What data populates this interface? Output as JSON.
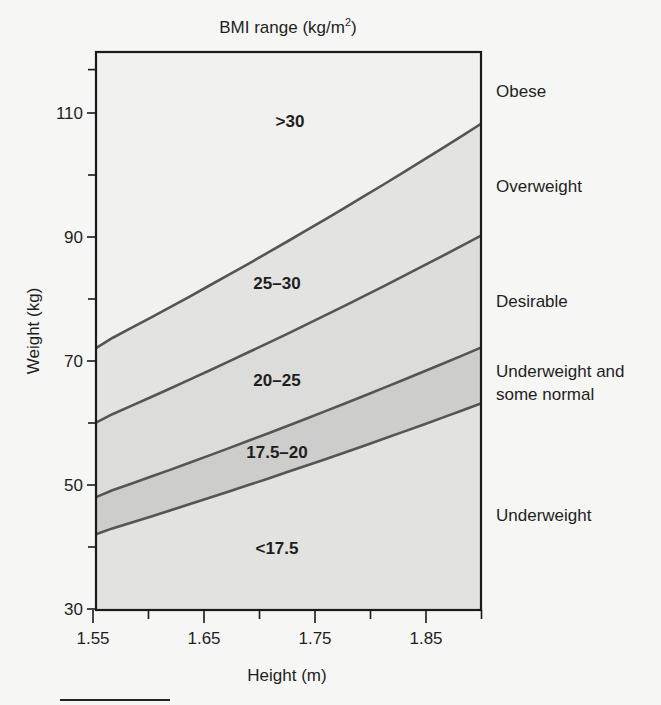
{
  "chart_data": {
    "type": "area",
    "title_main": "BMI range (kg/m",
    "title_sup": "2",
    "title_close": ")",
    "xlabel": "Height (m)",
    "ylabel": "Weight (kg)",
    "xlim": [
      1.55,
      1.9
    ],
    "ylim": [
      30,
      118
    ],
    "x_ticks_major": [
      1.55,
      1.65,
      1.75,
      1.85
    ],
    "x_tick_labels": [
      "1.55",
      "1.65",
      "1.75",
      "1.85"
    ],
    "x_ticks_minor": [
      1.6,
      1.7,
      1.8,
      1.9
    ],
    "y_ticks_major": [
      30,
      50,
      70,
      90,
      110
    ],
    "y_tick_labels": [
      "30",
      "50",
      "70",
      "90",
      "110"
    ],
    "y_ticks_minor": [
      40,
      60,
      80,
      100,
      117
    ],
    "grid": false,
    "boundary_lines": [
      {
        "bmi": 30,
        "x": [
          1.55,
          1.9
        ],
        "y": [
          72.1,
          108.3
        ]
      },
      {
        "bmi": 25,
        "x": [
          1.55,
          1.9
        ],
        "y": [
          60.1,
          90.3
        ]
      },
      {
        "bmi": 20,
        "x": [
          1.55,
          1.9
        ],
        "y": [
          48.1,
          72.2
        ]
      },
      {
        "bmi": 17.5,
        "x": [
          1.55,
          1.9
        ],
        "y": [
          42.0,
          63.2
        ]
      }
    ],
    "bands": [
      {
        "range_label": ">30",
        "category": "Obese",
        "fill": "#f1f1ef"
      },
      {
        "range_label": "25–30",
        "category": "Overweight",
        "fill": "#e3e3e1"
      },
      {
        "range_label": "20–25",
        "category": "Desirable",
        "fill": "#dcdcda"
      },
      {
        "range_label": "17.5–20",
        "category": "Underweight and some normal",
        "fill": "#cdcdcb"
      },
      {
        "range_label": "<17.5",
        "category": "Underweight",
        "fill": "#e2e2e0"
      }
    ],
    "category_labels": [
      {
        "lines": [
          "Obese"
        ]
      },
      {
        "lines": [
          "Overweight"
        ]
      },
      {
        "lines": [
          "Desirable"
        ]
      },
      {
        "lines": [
          "Underweight and",
          "some normal"
        ]
      },
      {
        "lines": [
          "Underweight"
        ]
      }
    ],
    "line_color": "#555555",
    "axis_color": "#1a1a1a"
  }
}
